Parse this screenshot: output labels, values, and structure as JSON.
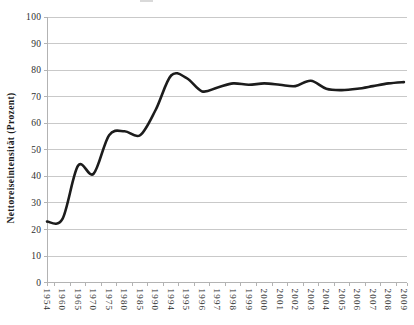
{
  "chart_data": {
    "type": "line",
    "title": "",
    "xlabel": "",
    "ylabel": "Nettoreiseintensität (Prozent)",
    "ylim": [
      0,
      100
    ],
    "ytick_step": 10,
    "grid": true,
    "legend_position": "none",
    "smooth": true,
    "categories": [
      "1954",
      "1960",
      "1965",
      "1970",
      "1975",
      "1980",
      "1985",
      "1990",
      "1994",
      "1995",
      "1996",
      "1997",
      "1998",
      "1999",
      "2000",
      "2001",
      "2002",
      "2003",
      "2004",
      "2005",
      "2006",
      "2007",
      "2008",
      "2009"
    ],
    "series": [
      {
        "name": "Nettoreiseintensität",
        "values": [
          23,
          24,
          44,
          41,
          55.5,
          57,
          55.5,
          65,
          78,
          77,
          72,
          73.5,
          75,
          74.5,
          75,
          74.5,
          74,
          76,
          73,
          72.5,
          73,
          74,
          75,
          75.5
        ]
      }
    ]
  },
  "styles": {
    "line_color": "#1c1c1c",
    "grid_color": "#c9c9c9",
    "axis_color": "#b3b3b3",
    "text_color": "#2e2e2e"
  }
}
